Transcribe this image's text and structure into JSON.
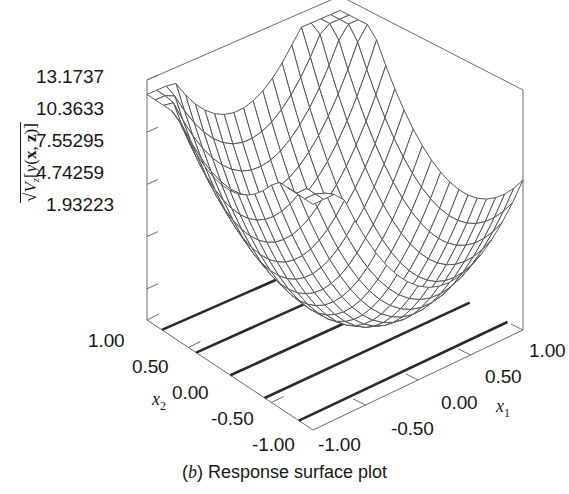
{
  "caption": {
    "prefix_open": "(",
    "letter": "b",
    "prefix_close": ")",
    "text": "Response surface plot",
    "full": "(b) Response surface plot"
  },
  "axes": {
    "z": {
      "title_plain": "sqrt(V_z[y(x, z)])",
      "radical": "√",
      "v_symbol": "V",
      "v_subscript": "z",
      "bracket_open": "[",
      "y_symbol": "y",
      "paren_open": "(",
      "x_bold": "x",
      "comma": ", ",
      "z_bold": "z",
      "paren_close": ")",
      "bracket_close": "]",
      "ticks": [
        "13.1737",
        "10.3633",
        "7.55295",
        "4.74259",
        "1.93223"
      ],
      "tick_values": [
        13.1737,
        10.3633,
        7.55295,
        4.74259,
        1.93223
      ]
    },
    "x1": {
      "name": "x",
      "subscript": "1",
      "ticks": [
        "1.00",
        "0.50",
        "0.00",
        "-0.50",
        "-1.00"
      ],
      "tick_values": [
        1.0,
        0.5,
        0.0,
        -0.5,
        -1.0
      ]
    },
    "x2": {
      "name": "x",
      "subscript": "2",
      "ticks": [
        "1.00",
        "0.50",
        "0.00",
        "-0.50",
        "-1.00"
      ],
      "tick_values": [
        1.0,
        0.5,
        0.0,
        -0.5,
        -1.0
      ]
    }
  },
  "colors": {
    "background": "#ffffff",
    "frame_line": "#6b6b6b",
    "mesh_line": "#585858",
    "contour_line": "#2b2b2b",
    "text": "#181818"
  },
  "chart_data": {
    "type": "surface",
    "xlabel": "x1",
    "ylabel": "x2",
    "zlabel": "sqrt(V_z[y(x, z)])",
    "xlim": [
      -1.0,
      1.0
    ],
    "ylim": [
      -1.0,
      1.0
    ],
    "zlim": [
      1.93223,
      13.1737
    ],
    "grid": false,
    "legend": "none",
    "mesh_n": 20,
    "projection": {
      "elevation_deg": 22,
      "azimuth_deg": 45
    },
    "base_plane": {
      "description": "contour projection on floor",
      "contour_count": 5,
      "orientation": "lines parallel to x1 axis at constant x2"
    },
    "surface_description": "Bowl / valley shaped response surface rising toward all four corners with a minimum near the front-center of the domain; the surface dips down to touch the base plane.",
    "z_at_corners": {
      "x1=-1,x2=-1": 11.5,
      "x1=1,x2=-1": 12.0,
      "x1=-1,x2=1": 12.5,
      "x1=1,x2=1": 13.17
    },
    "z_minimum": {
      "x1": 0.15,
      "x2": -0.2,
      "value": 1.93223
    }
  }
}
